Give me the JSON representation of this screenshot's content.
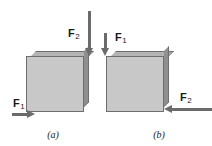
{
  "figure": {
    "background_color": "#ffffff"
  },
  "colors": {
    "block_front": "#c8c8c8",
    "block_top": "#b4b4b4",
    "block_side": "#8f8f8f",
    "block_outline": "#6e6e6e",
    "arrow": "#6b6b6b",
    "text": "#1a1a1a"
  },
  "panels": [
    {
      "id": "a",
      "caption": "(a)",
      "forces": [
        {
          "name": "F2",
          "label_base": "F",
          "label_sub": "2",
          "direction": "down",
          "application_point": "top-right-corner"
        },
        {
          "name": "F1",
          "label_base": "F",
          "label_sub": "1",
          "direction": "right",
          "application_point": "bottom-left-corner"
        }
      ]
    },
    {
      "id": "b",
      "caption": "(b)",
      "forces": [
        {
          "name": "F1",
          "label_base": "F",
          "label_sub": "1",
          "direction": "down",
          "application_point": "top-left-corner"
        },
        {
          "name": "F2",
          "label_base": "F",
          "label_sub": "2",
          "direction": "left",
          "application_point": "bottom-right-corner"
        }
      ]
    }
  ]
}
